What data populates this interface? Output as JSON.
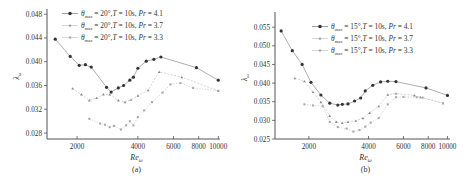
{
  "figure": {
    "panels": [
      "(a)",
      "(b)"
    ]
  },
  "chart_data": [
    {
      "type": "line",
      "panel_label": "(a)",
      "title": "",
      "xlabel": "Re_ω",
      "ylabel": "λ_ω",
      "xscale": "log",
      "xticks": [
        2000,
        4000,
        6000,
        8000,
        10000
      ],
      "xtick_labels": [
        "2000",
        "4000",
        "6000",
        "8000",
        "10000"
      ],
      "yticks": [
        0.028,
        0.032,
        0.036,
        0.04,
        0.044,
        0.048
      ],
      "ytick_labels": [
        "0.028",
        "0.032",
        "0.036",
        "0.040",
        "0.044",
        "0.048"
      ],
      "xlim": [
        1420,
        10200
      ],
      "ylim": [
        0.027,
        0.0482
      ],
      "grid": false,
      "legend_position": "upper right",
      "series": [
        {
          "name": "θmax = 20°, T = 10s, Pr = 4.1",
          "theta": "20°",
          "T": "10s",
          "Pr": "4.1",
          "marker": "circle",
          "color": "#333333",
          "x": [
            1560,
            1850,
            2050,
            2200,
            2350,
            2800,
            2950,
            3200,
            3400,
            3650,
            3800,
            4000,
            4400,
            4800,
            5200,
            7800,
            10000
          ],
          "y": [
            0.0438,
            0.0409,
            0.0394,
            0.0395,
            0.0391,
            0.0357,
            0.0349,
            0.0356,
            0.036,
            0.0369,
            0.0374,
            0.0389,
            0.0401,
            0.0404,
            0.0408,
            0.039,
            0.0369
          ]
        },
        {
          "name": "θmax = 20°, T = 10s, Pr = 3.7",
          "theta": "20°",
          "T": "10s",
          "Pr": "3.7",
          "marker": "triangle",
          "color": "#888888",
          "x": [
            1900,
            2100,
            2300,
            2500,
            2700,
            2900,
            3200,
            3450,
            3700,
            4000,
            4500,
            5100,
            6600,
            10000
          ],
          "y": [
            0.0355,
            0.0345,
            0.0335,
            0.0339,
            0.0345,
            0.0345,
            0.0335,
            0.0332,
            0.0336,
            0.0343,
            0.0352,
            0.0383,
            0.0374,
            0.0351
          ],
          "note": "additional points around Re≈5500-7000 ~0.037-0.038"
        },
        {
          "name": "θmax = 20°, T = 10s, Pr = 3.3",
          "theta": "20°",
          "T": "10s",
          "Pr": "3.3",
          "marker": "square",
          "color": "#aaaaaa",
          "x": [
            2300,
            2600,
            2750,
            2900,
            3050,
            3300,
            3500,
            3650,
            3800,
            4000,
            4300,
            4700,
            5300,
            5800,
            6500,
            7500,
            10000
          ],
          "y": [
            0.0304,
            0.0296,
            0.0294,
            0.029,
            0.0292,
            0.0286,
            0.0293,
            0.03,
            0.0293,
            0.0307,
            0.0318,
            0.0332,
            0.0348,
            0.0362,
            0.0364,
            0.0356,
            0.0351
          ]
        }
      ]
    },
    {
      "type": "line",
      "panel_label": "(b)",
      "title": "",
      "xlabel": "Re_ω",
      "ylabel": "λ_ω",
      "xscale": "log",
      "xticks": [
        2000,
        4000,
        6000,
        8000,
        10000
      ],
      "xtick_labels": [
        "2000",
        "4000",
        "6000",
        "8000",
        "10000"
      ],
      "yticks": [
        0.025,
        0.03,
        0.035,
        0.04,
        0.045,
        0.05,
        0.055
      ],
      "ytick_labels": [
        "0.025",
        "0.030",
        "0.035",
        "0.040",
        "0.045",
        "0.050",
        "0.055"
      ],
      "xlim": [
        1350,
        10300
      ],
      "ylim": [
        0.025,
        0.058
      ],
      "grid": false,
      "legend_position": "upper right",
      "series": [
        {
          "name": "θmax = 15°, T = 10s, Pr = 4.1",
          "theta": "15°",
          "T": "10s",
          "Pr": "4.1",
          "marker": "circle",
          "color": "#333333",
          "x": [
            1450,
            1650,
            1850,
            2050,
            2300,
            2550,
            2800,
            2950,
            3150,
            3400,
            3650,
            3850,
            4200,
            4600,
            5000,
            5500,
            7800,
            10000
          ],
          "y": [
            0.054,
            0.0487,
            0.045,
            0.0402,
            0.0368,
            0.0346,
            0.0341,
            0.0343,
            0.0344,
            0.0352,
            0.036,
            0.0379,
            0.0394,
            0.0403,
            0.0405,
            0.0404,
            0.0387,
            0.0367
          ]
        },
        {
          "name": "θmax = 15°, T = 10s, Pr = 3.7",
          "theta": "15°",
          "T": "10s",
          "Pr": "3.7",
          "marker": "triangle",
          "color": "#888888",
          "x": [
            1700,
            1900,
            2100,
            2300,
            2550,
            2750,
            2950,
            3150,
            3450,
            3750,
            4050,
            4500,
            5000,
            5500,
            6800,
            7300,
            9500
          ],
          "y": [
            0.0413,
            0.0405,
            0.0376,
            0.0349,
            0.0312,
            0.0296,
            0.0293,
            0.0296,
            0.0299,
            0.0306,
            0.032,
            0.0338,
            0.0369,
            0.0372,
            0.0367,
            0.0362,
            0.0346
          ]
        },
        {
          "name": "θmax = 15°, T = 10s, Pr = 3.3",
          "theta": "15°",
          "T": "10s",
          "Pr": "3.3",
          "marker": "square",
          "color": "#aaaaaa",
          "x": [
            1900,
            2100,
            2350,
            2550,
            2800,
            3100,
            3350,
            3600,
            3850,
            4100,
            4500,
            5000,
            5500,
            6000,
            7000,
            7500,
            9500
          ],
          "y": [
            0.0343,
            0.034,
            0.0338,
            0.0296,
            0.0282,
            0.0278,
            0.027,
            0.0274,
            0.0283,
            0.0294,
            0.0306,
            0.0343,
            0.0362,
            0.0363,
            0.0362,
            0.0361,
            0.0346
          ]
        }
      ]
    }
  ]
}
